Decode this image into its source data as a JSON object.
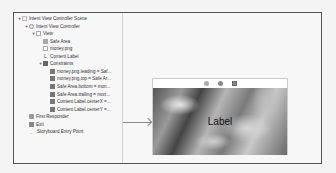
{
  "outline": {
    "items": [
      {
        "label": "Intent View Controller Scene",
        "indent": 0,
        "disclosure": "▼",
        "icon": "scene"
      },
      {
        "label": "Intent View Controller",
        "indent": 1,
        "disclosure": "▼",
        "icon": "vc"
      },
      {
        "label": "View",
        "indent": 2,
        "disclosure": "▼",
        "icon": "view"
      },
      {
        "label": "Safe Area",
        "indent": 3,
        "disclosure": "",
        "icon": "safe"
      },
      {
        "label": "money.png",
        "indent": 3,
        "disclosure": "",
        "icon": "img"
      },
      {
        "label": "Content Label",
        "indent": 3,
        "disclosure": "",
        "icon": "lbl"
      },
      {
        "label": "Constraints",
        "indent": 3,
        "disclosure": "▼",
        "icon": "cons"
      },
      {
        "label": "money.png.leading = Saf...",
        "indent": 4,
        "disclosure": "",
        "icon": "c"
      },
      {
        "label": "money.png.top = Safe Ar...",
        "indent": 4,
        "disclosure": "",
        "icon": "c"
      },
      {
        "label": "Safe Area.bottom = mon...",
        "indent": 4,
        "disclosure": "",
        "icon": "c"
      },
      {
        "label": "Safe Area.trailing = mon...",
        "indent": 4,
        "disclosure": "",
        "icon": "c"
      },
      {
        "label": "Content Label.centerX =...",
        "indent": 4,
        "disclosure": "",
        "icon": "c"
      },
      {
        "label": "Content Label.centerY =...",
        "indent": 4,
        "disclosure": "",
        "icon": "c"
      },
      {
        "label": "First Responder",
        "indent": 1,
        "disclosure": "",
        "icon": "fr"
      },
      {
        "label": "Exit",
        "indent": 1,
        "disclosure": "",
        "icon": "exit"
      },
      {
        "label": "Storyboard Entry Point",
        "indent": 1,
        "disclosure": "",
        "icon": "entry"
      }
    ]
  },
  "canvas": {
    "scene_toolbar": [
      "first-responder-icon",
      "view-controller-icon",
      "exit-icon"
    ],
    "content_label": "Label",
    "lbl_glyph": "L",
    "entry_glyph": "→"
  }
}
